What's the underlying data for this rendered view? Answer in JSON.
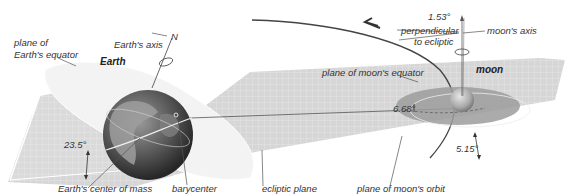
{
  "diagram": {
    "bodies": {
      "earth": "Earth",
      "moon": "moon"
    },
    "labels": {
      "plane_of_earths_equator_line1": "plane of",
      "plane_of_earths_equator_line2": "Earth's equator",
      "earths_axis": "Earth's axis",
      "north": "N",
      "earths_center_of_mass": "Earth's center of mass",
      "barycenter": "barycenter",
      "ecliptic_plane": "ecliptic plane",
      "plane_of_moons_orbit": "plane of moon's orbit",
      "plane_of_moons_equator": "plane of moon's equator",
      "perpendicular_line1": "perpendicular",
      "perpendicular_line2": "to ecliptic",
      "moons_axis": "moon's axis"
    },
    "angles": {
      "earth_tilt": "23.5°",
      "moon_axis_tilt": "1.53°",
      "moon_equator_to_orbit": "6.68°",
      "orbit_inclination": "5.15°"
    },
    "colors": {
      "ecliptic_plane": "#d8d8d8",
      "grid_line": "#f2f2f2",
      "earth_equator_plane": "#eeeeee",
      "moon_equator_plane": "#9a9a9a",
      "orbit_line": "#444444",
      "earth_ocean": "#4a4a4a",
      "earth_land": "#8c8c8c",
      "moon_surface": "#b5b5b5"
    }
  }
}
